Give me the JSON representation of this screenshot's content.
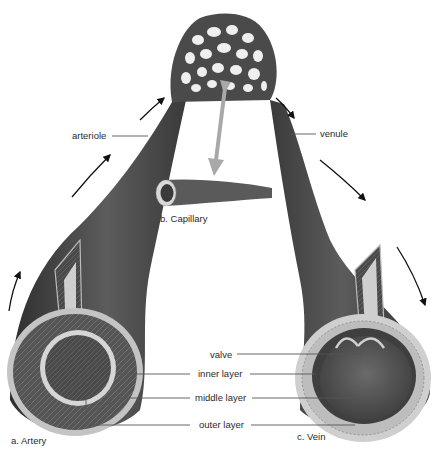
{
  "labels": {
    "arteriole": "arteriole",
    "venule": "venule",
    "capillary": "b. Capillary",
    "artery": "a. Artery",
    "vein": "c. Vein",
    "valve": "valve",
    "inner_layer": "inner layer",
    "middle_layer": "middle layer",
    "outer_layer": "outer layer"
  },
  "colors": {
    "vessel_dark": "#3a3a3a",
    "vessel_mid": "#5a5a5a",
    "wall_light": "#b8b8b8",
    "leader_line": "#555555",
    "pointer_arrow": "#a8a8a8",
    "flow_arrow": "#111111"
  }
}
